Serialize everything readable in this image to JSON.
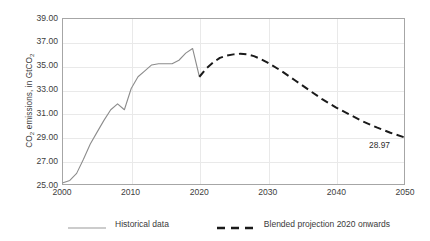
{
  "chart_data": {
    "type": "line",
    "title": "",
    "xlabel": "",
    "ylabel": "CO2 emissions, in GtCO2",
    "ylabel_parts": {
      "pre": "CO",
      "sub1": "2",
      "mid": " emissions, in GtCO",
      "sub2": "2"
    },
    "xlim": [
      2000,
      2050
    ],
    "ylim": [
      25.0,
      39.0
    ],
    "ytick_step": 2.0,
    "grid": {
      "horizontal": true,
      "vertical": true
    },
    "ytick_labels": [
      "39.00",
      "37.00",
      "35.00",
      "33.00",
      "31.00",
      "29.00",
      "27.00",
      "25.00"
    ],
    "ytick_values": [
      39.0,
      37.0,
      35.0,
      33.0,
      31.0,
      29.0,
      27.0,
      25.0
    ],
    "xtick_labels": [
      "2000",
      "2010",
      "2020",
      "2030",
      "2040",
      "2050"
    ],
    "xtick_values": [
      2000,
      2010,
      2020,
      2030,
      2040,
      2050
    ],
    "legend_position": "bottom",
    "annotations": [
      {
        "text": "28.97",
        "x": 2050,
        "y": 28.97,
        "series": "Blended projection 2020 onwards"
      }
    ],
    "series": [
      {
        "name": "Historical data",
        "style": "solid",
        "color": "#8c8c8c",
        "width": 1.1,
        "x": [
          2000,
          2001,
          2002,
          2003,
          2004,
          2005,
          2006,
          2007,
          2008,
          2009,
          2010,
          2011,
          2012,
          2013,
          2014,
          2015,
          2016,
          2017,
          2018,
          2019,
          2020
        ],
        "values": [
          25.1,
          25.3,
          25.9,
          27.1,
          28.4,
          29.4,
          30.4,
          31.3,
          31.8,
          31.3,
          33.1,
          34.1,
          34.6,
          35.1,
          35.2,
          35.2,
          35.2,
          35.5,
          36.1,
          36.5,
          34.1
        ]
      },
      {
        "name": "Blended projection 2020 onwards",
        "style": "dashed",
        "color": "#1a1a1a",
        "width": 2.0,
        "x": [
          2020,
          2021,
          2022,
          2023,
          2024,
          2025,
          2026,
          2027,
          2028,
          2029,
          2030,
          2032,
          2034,
          2036,
          2038,
          2040,
          2042,
          2044,
          2046,
          2048,
          2050
        ],
        "values": [
          34.1,
          34.8,
          35.3,
          35.7,
          35.9,
          36.0,
          36.05,
          36.0,
          35.85,
          35.6,
          35.3,
          34.6,
          33.8,
          33.0,
          32.2,
          31.5,
          30.9,
          30.3,
          29.8,
          29.35,
          28.97
        ]
      }
    ]
  },
  "legend": {
    "entries": [
      {
        "label": "Historical data",
        "swatch": "solid-gray-line"
      },
      {
        "label": "Blended projection 2020 onwards",
        "swatch": "dashed-black-line"
      }
    ]
  }
}
